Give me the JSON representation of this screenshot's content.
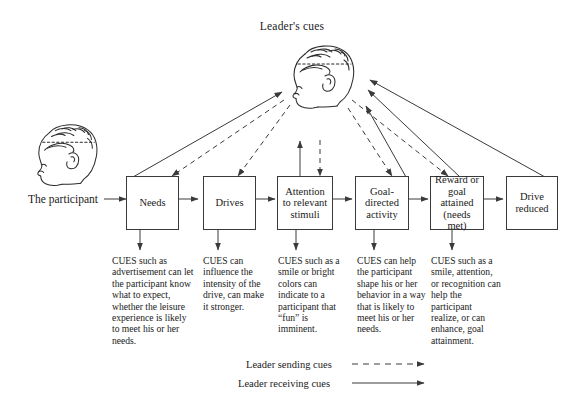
{
  "labels": {
    "leaders_cues": "Leader's cues",
    "the_participant": "The participant"
  },
  "icons": {
    "leader_head": "leader-head-profile-icon",
    "participant_head": "participant-head-profile-icon"
  },
  "flow": {
    "boxes": [
      {
        "id": "needs",
        "label": "Needs"
      },
      {
        "id": "drives",
        "label": "Drives"
      },
      {
        "id": "attention",
        "label": "Attention\nto relevant\nstimuli"
      },
      {
        "id": "goal",
        "label": "Goal-\ndirected\nactivity"
      },
      {
        "id": "reward",
        "label": "Reward or\ngoal\nattained\n(needs met)"
      },
      {
        "id": "drive_reduced",
        "label": "Drive\nreduced"
      }
    ]
  },
  "cues": [
    {
      "id": "cue-needs",
      "text": "CUES such as advertisement can let the participant know what to expect, whether the leisure experience is likely to meet his or her needs."
    },
    {
      "id": "cue-drives",
      "text": "CUES can influence the intensity of the drive, can make it stronger."
    },
    {
      "id": "cue-attention",
      "text": "CUES such as a smile or bright colors can indicate to a participant that “fun” is imminent."
    },
    {
      "id": "cue-goal",
      "text": "CUES can help the participant shape his or her behavior in a way that is likely to meet his or her needs."
    },
    {
      "id": "cue-reward",
      "text": "CUES such as a smile, attention, or recognition can help the participant realize, or can enhance, goal attainment."
    }
  ],
  "legend": {
    "sending": "Leader sending cues",
    "receiving": "Leader receiving cues",
    "sending_style": "dashed-arrow",
    "receiving_style": "solid-arrow"
  },
  "colors": {
    "line": "#3a3a3a",
    "text": "#1a1a1a",
    "background": "#ffffff"
  }
}
